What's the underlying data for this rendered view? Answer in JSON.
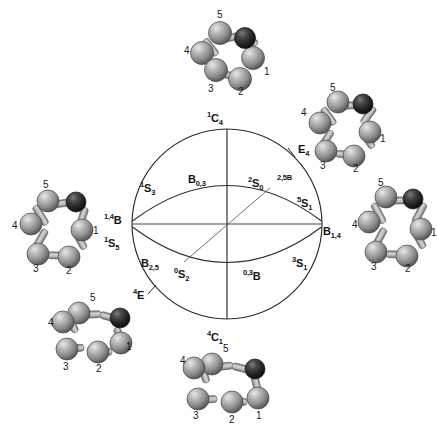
{
  "figure": {
    "type": "cremer-pople-conformational-sphere",
    "sphere": {
      "center_x": 227,
      "center_y": 224,
      "radius": 95,
      "stroke": "#2b2b2b",
      "fill": "#ffffff"
    },
    "labels": [
      {
        "id": "north-pole",
        "html": "<sup>1</sup>C<sub>4</sub>",
        "x": 207,
        "y": 111,
        "name": "label-1c4"
      },
      {
        "id": "south-pole",
        "html": "<sup>4</sup>C<sub>1</sub>",
        "x": 207,
        "y": 330,
        "name": "label-4c1"
      },
      {
        "id": "upper-front-center",
        "html": "B<sub>0,3</sub>",
        "x": 188,
        "y": 174,
        "name": "label-b03"
      },
      {
        "id": "upper-right",
        "html": "<sup>2</sup>S<sub>0</sub>",
        "x": 248,
        "y": 176,
        "name": "label-2s0"
      },
      {
        "id": "upper-far-right",
        "html": "<sup>2,5</sub>B",
        "x": 277,
        "y": 174,
        "name": "label-25b"
      },
      {
        "id": "upper-left",
        "html": "<sup>1</sup>S<sub>3</sub>",
        "x": 140,
        "y": 181,
        "name": "label-1s3"
      },
      {
        "id": "equator-left-upper",
        "html": "<sup>1,4</sup>B",
        "x": 104,
        "y": 213,
        "name": "label-14b"
      },
      {
        "id": "equator-left-lower",
        "html": "<sup>1</sup>S<sub>5</sub>",
        "x": 104,
        "y": 236,
        "name": "label-1s5"
      },
      {
        "id": "equator-right",
        "html": "B<sub>1,4</sub>",
        "x": 323,
        "y": 226,
        "name": "label-b14"
      },
      {
        "id": "right-upper",
        "html": "<sup>5</sup>S<sub>1</sub>",
        "x": 297,
        "y": 196,
        "name": "label-5s1"
      },
      {
        "id": "right-lower",
        "html": "<sup>3</sup>S<sub>1</sub>",
        "x": 292,
        "y": 256,
        "name": "label-3s1"
      },
      {
        "id": "lower-left",
        "html": "B<sub>2,5</sub>",
        "x": 141,
        "y": 258,
        "name": "label-b25"
      },
      {
        "id": "lower-front-left",
        "html": "<sup>0</sup>S<sub>2</sub>",
        "x": 174,
        "y": 267,
        "name": "label-0s2"
      },
      {
        "id": "lower-front-right",
        "html": "<sup>0,3</sup>B",
        "x": 243,
        "y": 269,
        "name": "label-03b"
      },
      {
        "id": "lower-far-left",
        "html": "<sup>4</sup>E",
        "x": 133,
        "y": 288,
        "name": "label-4e"
      },
      {
        "id": "upper-far-right-tick",
        "html": "E<sub>4</sub>",
        "x": 298,
        "y": 144,
        "name": "label-e4"
      }
    ],
    "tick_marks": [
      {
        "name": "tick-e4",
        "x1": 288,
        "y1": 148,
        "x2": 295,
        "y2": 157
      },
      {
        "name": "tick-4e",
        "x1": 148,
        "y1": 294,
        "x2": 156,
        "y2": 285
      }
    ],
    "molecules": [
      {
        "name": "molecule-top",
        "position": "top",
        "conformer_ref": "1C4",
        "x": 183,
        "y": 8,
        "w": 92,
        "h": 90,
        "atom_labels": [
          {
            "text": "5",
            "x": 34,
            "y": 2
          },
          {
            "text": "4",
            "x": 2,
            "y": 38
          },
          {
            "text": "3",
            "x": 26,
            "y": 76
          },
          {
            "text": "2",
            "x": 56,
            "y": 78
          },
          {
            "text": "1",
            "x": 80,
            "y": 60
          }
        ]
      },
      {
        "name": "molecule-top-right",
        "position": "top-right",
        "conformer_ref": "E4",
        "x": 300,
        "y": 82,
        "w": 92,
        "h": 92,
        "atom_labels": [
          {
            "text": "5",
            "x": 30,
            "y": 2
          },
          {
            "text": "4",
            "x": 2,
            "y": 26
          },
          {
            "text": "3",
            "x": 22,
            "y": 76
          },
          {
            "text": "2",
            "x": 54,
            "y": 78
          },
          {
            "text": "1",
            "x": 78,
            "y": 52
          }
        ]
      },
      {
        "name": "molecule-right",
        "position": "right",
        "conformer_ref": "B1,4",
        "x": 352,
        "y": 178,
        "w": 90,
        "h": 96,
        "atom_labels": [
          {
            "text": "5",
            "x": 26,
            "y": 2
          },
          {
            "text": "4",
            "x": 0,
            "y": 42
          },
          {
            "text": "3",
            "x": 22,
            "y": 82
          },
          {
            "text": "2",
            "x": 54,
            "y": 82
          },
          {
            "text": "1",
            "x": 76,
            "y": 48
          }
        ]
      },
      {
        "name": "molecule-bottom",
        "position": "bottom",
        "conformer_ref": "4C1",
        "x": 180,
        "y": 344,
        "w": 96,
        "h": 88,
        "atom_labels": [
          {
            "text": "5",
            "x": 44,
            "y": 0
          },
          {
            "text": "4",
            "x": 2,
            "y": 14
          },
          {
            "text": "3",
            "x": 14,
            "y": 66
          },
          {
            "text": "2",
            "x": 50,
            "y": 70
          },
          {
            "text": "1",
            "x": 76,
            "y": 66
          }
        ]
      },
      {
        "name": "molecule-bottom-left",
        "position": "bottom-left",
        "conformer_ref": "4E",
        "x": 48,
        "y": 292,
        "w": 94,
        "h": 86,
        "atom_labels": [
          {
            "text": "5",
            "x": 44,
            "y": 2
          },
          {
            "text": "4",
            "x": 0,
            "y": 30
          },
          {
            "text": "3",
            "x": 20,
            "y": 70
          },
          {
            "text": "2",
            "x": 52,
            "y": 70
          },
          {
            "text": "1",
            "x": 76,
            "y": 50
          }
        ]
      },
      {
        "name": "molecule-left",
        "position": "left",
        "conformer_ref": "1,4B",
        "x": 12,
        "y": 178,
        "w": 94,
        "h": 96,
        "atom_labels": [
          {
            "text": "5",
            "x": 32,
            "y": 2
          },
          {
            "text": "4",
            "x": 0,
            "y": 40
          },
          {
            "text": "3",
            "x": 22,
            "y": 82
          },
          {
            "text": "2",
            "x": 54,
            "y": 82
          },
          {
            "text": "1",
            "x": 80,
            "y": 44
          }
        ]
      }
    ],
    "colors": {
      "carbon_atom": "#8a8a8a",
      "carbon_highlight": "#d8d8d8",
      "carbon_shadow": "#4a4a4a",
      "hetero_atom": "#1f1f1f",
      "hetero_highlight": "#6a6a6a",
      "bond": "#b0b0b0",
      "bond_edge": "#5a5a5a",
      "line": "#2b2b2b",
      "text": "#141414",
      "background": "#ffffff"
    }
  }
}
